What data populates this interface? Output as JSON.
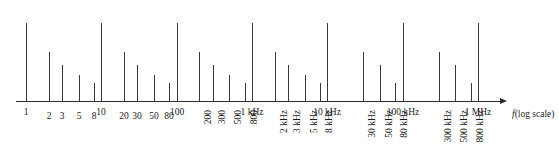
{
  "figure": {
    "type": "frequency-spectrum-log-axis",
    "axis_caption_variable": "f",
    "axis_caption_scale": "(log scale)",
    "line_color": "#3a3a3a",
    "axis_color": "#2b2b2b",
    "background": "#ffffff"
  },
  "chart_data": {
    "type": "bar",
    "title": "",
    "subtitle": "",
    "xlabel": "f (log scale)",
    "ylabel": "",
    "xscale": "log",
    "grid": false,
    "legend": null,
    "xlim": [
      1,
      1000000
    ],
    "ylim": [
      0,
      1
    ],
    "categories": [
      "1",
      "2",
      "3",
      "5",
      "8",
      "10",
      "20",
      "30",
      "50",
      "80",
      "100",
      "200",
      "300",
      "500",
      "800",
      "1 kHz",
      "2 kHz",
      "3 kHz",
      "5 kHz",
      "8 kHz",
      "10 kHz",
      "30 kHz",
      "50 kHz",
      "80 kHz",
      "100 kHz",
      "300 kHz",
      "500 kHz",
      "800 kHz",
      "1 MHz"
    ],
    "x": [
      1,
      2,
      3,
      5,
      8,
      10,
      20,
      30,
      50,
      80,
      100,
      200,
      300,
      500,
      800,
      1000,
      2000,
      3000,
      5000,
      8000,
      10000,
      30000,
      50000,
      80000,
      100000,
      300000,
      500000,
      800000,
      1000000
    ],
    "values": [
      1.0,
      0.63,
      0.46,
      0.33,
      0.23,
      1.0,
      0.63,
      0.46,
      0.33,
      0.23,
      1.0,
      0.63,
      0.46,
      0.33,
      0.23,
      1.0,
      0.63,
      0.46,
      0.33,
      0.23,
      1.0,
      0.63,
      0.46,
      0.23,
      1.0,
      0.63,
      0.46,
      0.23,
      1.0
    ],
    "label_orientation": [
      "horizontal",
      "horizontal",
      "horizontal",
      "horizontal",
      "horizontal",
      "horizontal",
      "horizontal",
      "horizontal",
      "horizontal",
      "horizontal",
      "horizontal",
      "vertical",
      "vertical",
      "vertical",
      "vertical",
      "horizontal",
      "vertical",
      "vertical",
      "vertical",
      "vertical",
      "horizontal",
      "vertical",
      "vertical",
      "vertical",
      "horizontal",
      "vertical",
      "vertical",
      "vertical",
      "horizontal"
    ]
  }
}
